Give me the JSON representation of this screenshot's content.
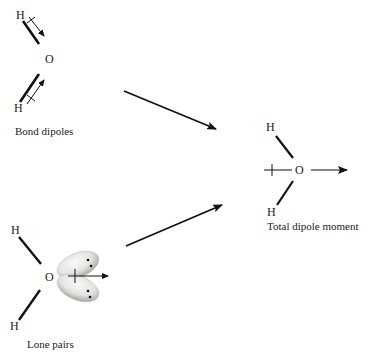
{
  "diagram": {
    "colors": {
      "ink": "#111111",
      "text": "#222222",
      "lobe_light": "#f4f4f2",
      "lobe_dark": "#9a9a96"
    },
    "bond_dipoles": {
      "caption": "Bond dipoles",
      "atoms": {
        "h_top": "H",
        "o": "O",
        "h_bottom": "H"
      }
    },
    "lone_pairs": {
      "caption": "Lone pairs",
      "atoms": {
        "h_top": "H",
        "o": "O",
        "h_bottom": "H"
      }
    },
    "total_dipole": {
      "caption": "Total dipole moment",
      "atoms": {
        "h_top": "H",
        "o": "O",
        "h_bottom": "H"
      }
    }
  }
}
